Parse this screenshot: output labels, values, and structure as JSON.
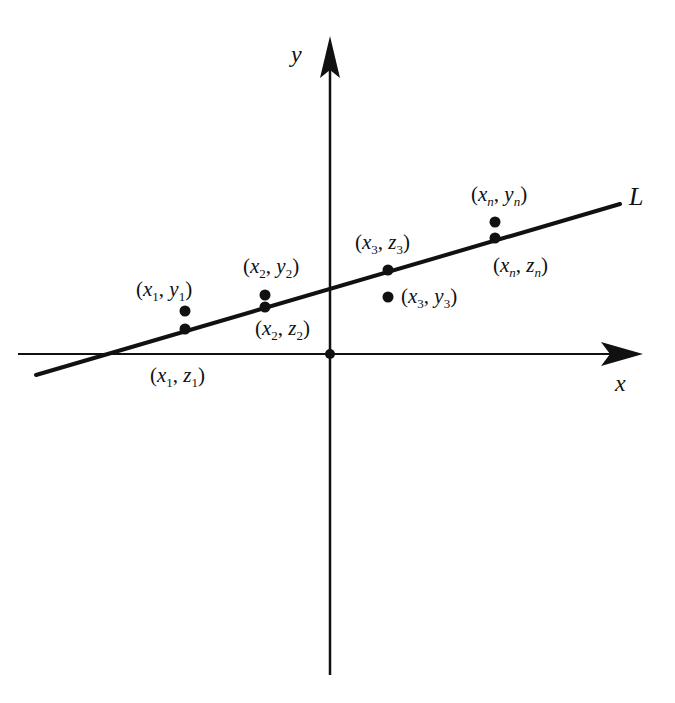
{
  "diagram": {
    "title_fragment": "",
    "axes": {
      "x_label": "x",
      "y_label": "y"
    },
    "line_label": "L",
    "colors": {
      "ink": "#111111",
      "background": "#ffffff"
    },
    "points": [
      {
        "id": "p1y",
        "x": "x",
        "xs": "1",
        "y": "y",
        "ys": "1",
        "kind": "data"
      },
      {
        "id": "p1z",
        "x": "x",
        "xs": "1",
        "y": "z",
        "ys": "1",
        "kind": "line"
      },
      {
        "id": "p2y",
        "x": "x",
        "xs": "2",
        "y": "y",
        "ys": "2",
        "kind": "data"
      },
      {
        "id": "p2z",
        "x": "x",
        "xs": "2",
        "y": "z",
        "ys": "2",
        "kind": "line"
      },
      {
        "id": "p3z",
        "x": "x",
        "xs": "3",
        "y": "z",
        "ys": "3",
        "kind": "line"
      },
      {
        "id": "p3y",
        "x": "x",
        "xs": "3",
        "y": "y",
        "ys": "3",
        "kind": "data"
      },
      {
        "id": "pny",
        "x": "x",
        "xs": "n",
        "y": "y",
        "ys": "n",
        "kind": "data"
      },
      {
        "id": "pnz",
        "x": "x",
        "xs": "n",
        "y": "z",
        "ys": "n",
        "kind": "line"
      }
    ],
    "punct": {
      "open": "(",
      "comma": ", ",
      "close": ")"
    }
  }
}
